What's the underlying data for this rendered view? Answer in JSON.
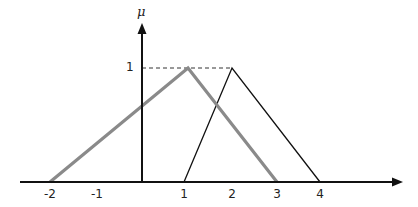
{
  "figure": {
    "y_axis_label": "μ",
    "y_tick_label": "1",
    "x_tick_labels": [
      "-2",
      "-1",
      "1",
      "2",
      "3",
      "4"
    ],
    "series": [
      {
        "name": "gray-triangle",
        "color": "#8a8a8a",
        "points": [
          [
            -2,
            0
          ],
          [
            1,
            1
          ],
          [
            3,
            0
          ]
        ]
      },
      {
        "name": "black-triangle",
        "color": "#111111",
        "points": [
          [
            1,
            0
          ],
          [
            2,
            1
          ],
          [
            4,
            0
          ]
        ]
      }
    ],
    "reference_line": {
      "style": "dashed",
      "y": 1,
      "x_from": 0,
      "x_to": 2
    }
  }
}
